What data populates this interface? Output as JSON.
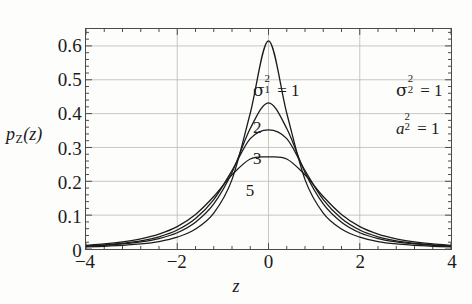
{
  "chart_data": {
    "type": "line",
    "title": "",
    "xlabel": "z",
    "ylabel": "p_Z(z)",
    "ylabel_base": "p",
    "ylabel_sub": "Z",
    "ylabel_arg": "(z)",
    "xlim": [
      -4,
      4
    ],
    "ylim": [
      0,
      0.65
    ],
    "grid": true,
    "legend_position": "inline-curve-labels",
    "xticks": [
      "-4",
      "-2",
      "0",
      "2",
      "4"
    ],
    "xtick_values": [
      -4,
      -2,
      0,
      2,
      4
    ],
    "yticks": [
      "0",
      "0.1",
      "0.2",
      "0.3",
      "0.4",
      "0.5",
      "0.6"
    ],
    "ytick_values": [
      0,
      0.1,
      0.2,
      0.3,
      0.4,
      0.5,
      0.6
    ],
    "gridlines_x": [
      -2,
      0,
      2
    ],
    "gridlines_y": [
      0.1,
      0.2,
      0.3,
      0.4,
      0.5,
      0.6
    ],
    "line_color": "#1b1b1b",
    "grid_color": "#b9b9b9",
    "axis_color": "#4a4a4a",
    "background_color": "#fdfdfb",
    "series": [
      {
        "name": "1",
        "label": "1",
        "peak": 0.615,
        "scale": 1.0,
        "x": [
          -4,
          -3.6,
          -3.2,
          -2.8,
          -2.4,
          -2,
          -1.6,
          -1.2,
          -0.8,
          -0.4,
          0,
          0.4,
          0.8,
          1.2,
          1.6,
          2,
          2.4,
          2.8,
          3.2,
          3.6,
          4
        ],
        "values": [
          0.006,
          0.008,
          0.011,
          0.015,
          0.022,
          0.035,
          0.059,
          0.106,
          0.205,
          0.401,
          0.615,
          0.401,
          0.205,
          0.106,
          0.059,
          0.035,
          0.022,
          0.015,
          0.011,
          0.008,
          0.006
        ]
      },
      {
        "name": "2",
        "label": "2",
        "peak": 0.432,
        "scale": 1.0,
        "x": [
          -4,
          -3.6,
          -3.2,
          -2.8,
          -2.4,
          -2,
          -1.6,
          -1.2,
          -0.8,
          -0.4,
          0,
          0.4,
          0.8,
          1.2,
          1.6,
          2,
          2.4,
          2.8,
          3.2,
          3.6,
          4
        ],
        "values": [
          0.008,
          0.011,
          0.015,
          0.021,
          0.031,
          0.048,
          0.079,
          0.133,
          0.226,
          0.356,
          0.432,
          0.356,
          0.226,
          0.133,
          0.079,
          0.048,
          0.031,
          0.021,
          0.015,
          0.011,
          0.008
        ]
      },
      {
        "name": "3",
        "label": "3",
        "peak": 0.352,
        "scale": 1.0,
        "x": [
          -4,
          -3.6,
          -3.2,
          -2.8,
          -2.4,
          -2,
          -1.6,
          -1.2,
          -0.8,
          -0.4,
          0,
          0.4,
          0.8,
          1.2,
          1.6,
          2,
          2.4,
          2.8,
          3.2,
          3.6,
          4
        ],
        "values": [
          0.009,
          0.012,
          0.017,
          0.024,
          0.036,
          0.056,
          0.09,
          0.146,
          0.232,
          0.326,
          0.352,
          0.326,
          0.232,
          0.146,
          0.09,
          0.056,
          0.036,
          0.024,
          0.017,
          0.012,
          0.009
        ]
      },
      {
        "name": "5",
        "label": "5",
        "peak": 0.272,
        "scale": 1.0,
        "x": [
          -4,
          -3.6,
          -3.2,
          -2.8,
          -2.4,
          -2,
          -1.6,
          -1.2,
          -0.8,
          -0.4,
          0,
          0.4,
          0.8,
          1.2,
          1.6,
          2,
          2.4,
          2.8,
          3.2,
          3.6,
          4
        ],
        "values": [
          0.011,
          0.015,
          0.021,
          0.03,
          0.044,
          0.066,
          0.102,
          0.155,
          0.219,
          0.266,
          0.272,
          0.266,
          0.219,
          0.155,
          0.102,
          0.066,
          0.044,
          0.03,
          0.021,
          0.015,
          0.011
        ]
      }
    ],
    "annotations": [
      {
        "id": "sigma1",
        "base": "σ",
        "sup": "2",
        "sub": "1",
        "eq": "= 1",
        "x_frac": 0.455,
        "y_frac": 0.225
      },
      {
        "id": "sigma2",
        "base": "σ",
        "sup": "2",
        "sub": "2",
        "eq": "= 1",
        "x_frac": 0.845,
        "y_frac": 0.225
      },
      {
        "id": "a2",
        "base": "a",
        "sup": "2",
        "sub": "2",
        "eq": "= 1",
        "x_frac": 0.845,
        "y_frac": 0.395,
        "italic": true
      }
    ],
    "curve_labels": [
      {
        "text": "2",
        "x_frac": 0.455,
        "y_frac": 0.405
      },
      {
        "text": "3",
        "x_frac": 0.455,
        "y_frac": 0.545
      },
      {
        "text": "5",
        "x_frac": 0.435,
        "y_frac": 0.69
      }
    ]
  }
}
